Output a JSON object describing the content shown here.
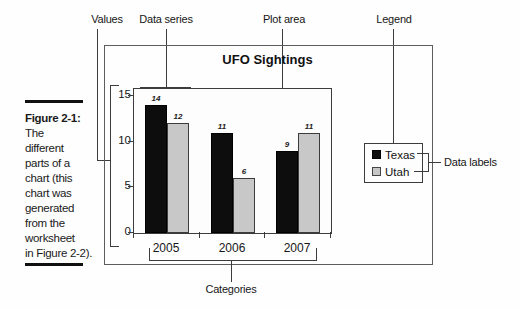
{
  "figure_caption": {
    "label": "Figure 2-1:",
    "lines": [
      "The",
      "different",
      "parts of a",
      "chart (this",
      "chart was",
      "generated",
      "from the",
      "worksheet",
      "in Figure 2-2)."
    ]
  },
  "callouts": {
    "values": "Values",
    "data_series": "Data series",
    "plot_area": "Plot area",
    "legend": "Legend",
    "data_labels": "Data labels",
    "categories": "Categories"
  },
  "chart_data": {
    "type": "bar",
    "title": "UFO Sightings",
    "categories": [
      "2005",
      "2006",
      "2007"
    ],
    "series": [
      {
        "name": "Texas",
        "color": "#0d0d0d",
        "values": [
          14,
          11,
          9
        ]
      },
      {
        "name": "Utah",
        "color": "#c8c8c8",
        "values": [
          12,
          6,
          11
        ]
      }
    ],
    "ylim": [
      0,
      15
    ],
    "yticks": [
      0,
      5,
      10,
      15
    ],
    "data_labels_shown": true,
    "legend_position": "right",
    "grid": false,
    "ink_color": "#3c3c3c"
  }
}
